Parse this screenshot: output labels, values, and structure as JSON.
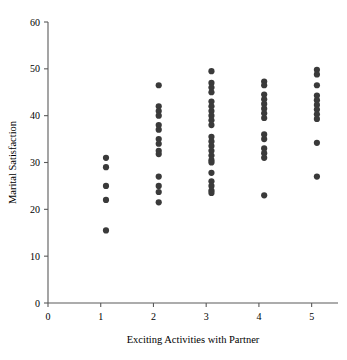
{
  "chart_data": {
    "type": "scatter",
    "title": "",
    "xlabel": "Exciting Activities with Partner",
    "ylabel": "Marital Satisfaction",
    "xlim": [
      0,
      5.5
    ],
    "ylim": [
      0,
      60
    ],
    "xticks": [
      0,
      1,
      2,
      3,
      4,
      5
    ],
    "xtick_labels": [
      "0",
      "1",
      "2",
      "3",
      "4",
      "5"
    ],
    "yticks": [
      0,
      10,
      20,
      30,
      40,
      50,
      60
    ],
    "ytick_labels": [
      "0",
      "10",
      "20",
      "30",
      "40",
      "50",
      "60"
    ],
    "grid": false,
    "legend": null,
    "marker": "circle",
    "marker_color": "#3a3a3a",
    "marker_size": 3.1,
    "point_count": 73,
    "points": [
      {
        "x": 1.1,
        "y": 31.0
      },
      {
        "x": 1.1,
        "y": 29.0
      },
      {
        "x": 1.1,
        "y": 25.0
      },
      {
        "x": 1.1,
        "y": 22.0
      },
      {
        "x": 1.1,
        "y": 15.5
      },
      {
        "x": 2.1,
        "y": 46.5
      },
      {
        "x": 2.1,
        "y": 42.0
      },
      {
        "x": 2.1,
        "y": 41.0
      },
      {
        "x": 2.1,
        "y": 40.0
      },
      {
        "x": 2.1,
        "y": 38.0
      },
      {
        "x": 2.1,
        "y": 37.0
      },
      {
        "x": 2.1,
        "y": 35.0
      },
      {
        "x": 2.1,
        "y": 34.0
      },
      {
        "x": 2.1,
        "y": 32.5
      },
      {
        "x": 2.1,
        "y": 31.8
      },
      {
        "x": 2.1,
        "y": 27.0
      },
      {
        "x": 2.1,
        "y": 25.0
      },
      {
        "x": 2.1,
        "y": 23.7
      },
      {
        "x": 2.1,
        "y": 21.5
      },
      {
        "x": 3.1,
        "y": 49.5
      },
      {
        "x": 3.1,
        "y": 47.0
      },
      {
        "x": 3.1,
        "y": 46.0
      },
      {
        "x": 3.1,
        "y": 45.0
      },
      {
        "x": 3.1,
        "y": 43.0
      },
      {
        "x": 3.1,
        "y": 42.0
      },
      {
        "x": 3.1,
        "y": 41.0
      },
      {
        "x": 3.1,
        "y": 40.0
      },
      {
        "x": 3.1,
        "y": 39.0
      },
      {
        "x": 3.1,
        "y": 38.0
      },
      {
        "x": 3.1,
        "y": 35.5
      },
      {
        "x": 3.1,
        "y": 34.5
      },
      {
        "x": 3.1,
        "y": 33.5
      },
      {
        "x": 3.1,
        "y": 32.5
      },
      {
        "x": 3.1,
        "y": 31.5
      },
      {
        "x": 3.1,
        "y": 30.5
      },
      {
        "x": 3.1,
        "y": 30.0
      },
      {
        "x": 3.1,
        "y": 27.8
      },
      {
        "x": 3.1,
        "y": 26.0
      },
      {
        "x": 3.1,
        "y": 25.0
      },
      {
        "x": 3.1,
        "y": 24.0
      },
      {
        "x": 3.1,
        "y": 23.5
      },
      {
        "x": 4.1,
        "y": 47.3
      },
      {
        "x": 4.1,
        "y": 46.5
      },
      {
        "x": 4.1,
        "y": 44.5
      },
      {
        "x": 4.1,
        "y": 43.5
      },
      {
        "x": 4.1,
        "y": 42.5
      },
      {
        "x": 4.1,
        "y": 41.5
      },
      {
        "x": 4.1,
        "y": 40.5
      },
      {
        "x": 4.1,
        "y": 39.5
      },
      {
        "x": 4.1,
        "y": 36.0
      },
      {
        "x": 4.1,
        "y": 35.0
      },
      {
        "x": 4.1,
        "y": 33.0
      },
      {
        "x": 4.1,
        "y": 32.0
      },
      {
        "x": 4.1,
        "y": 31.0
      },
      {
        "x": 4.1,
        "y": 23.0
      },
      {
        "x": 5.1,
        "y": 49.8
      },
      {
        "x": 5.1,
        "y": 48.8
      },
      {
        "x": 5.1,
        "y": 46.5
      },
      {
        "x": 5.1,
        "y": 44.3
      },
      {
        "x": 5.1,
        "y": 43.3
      },
      {
        "x": 5.1,
        "y": 42.3
      },
      {
        "x": 5.1,
        "y": 41.3
      },
      {
        "x": 5.1,
        "y": 40.3
      },
      {
        "x": 5.1,
        "y": 39.3
      },
      {
        "x": 5.1,
        "y": 34.2
      },
      {
        "x": 5.1,
        "y": 27.0
      }
    ]
  }
}
